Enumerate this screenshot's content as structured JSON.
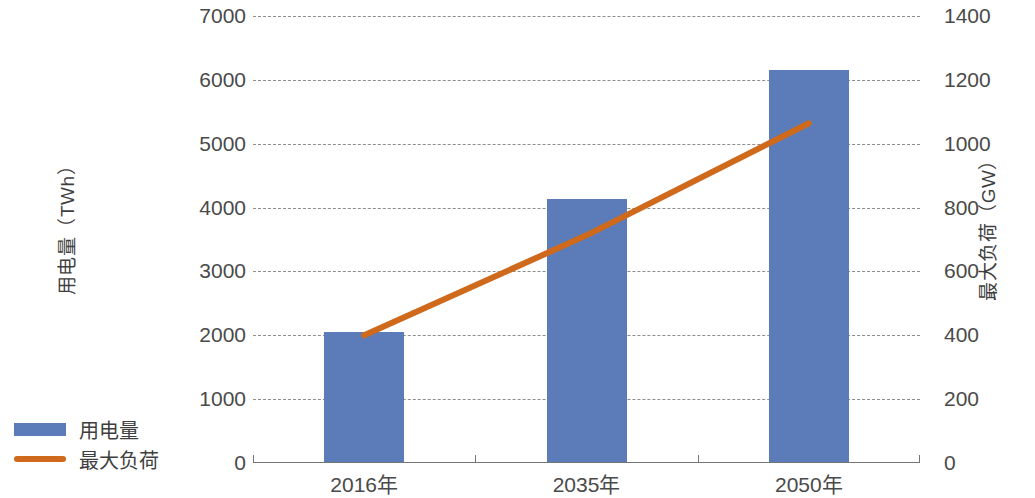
{
  "chart_data": {
    "type": "bar",
    "title": "",
    "subtitle": "",
    "categories": [
      "2016年",
      "2035年",
      "2050年"
    ],
    "series": [
      {
        "name": "用电量",
        "type": "bar",
        "axis": "left",
        "unit": "TWh",
        "color": "#5b7cb8",
        "values": [
          2050,
          4130,
          6150
        ]
      },
      {
        "name": "最大负荷",
        "type": "line",
        "axis": "right",
        "unit": "GW",
        "color": "#cf6a1d",
        "values": [
          400,
          713,
          1064
        ]
      }
    ],
    "xlabel": "",
    "ylabel": "用电量（TWh）",
    "y2label": "最大负荷（GW）",
    "ylim": [
      0,
      7000
    ],
    "y2lim": [
      0,
      1400
    ],
    "yticks": [
      "0",
      "1000",
      "2000",
      "3000",
      "4000",
      "5000",
      "6000",
      "7000"
    ],
    "ytick_values": [
      0,
      1000,
      2000,
      3000,
      4000,
      5000,
      6000,
      7000
    ],
    "y2ticks": [
      "0",
      "200",
      "400",
      "600",
      "800",
      "1000",
      "1200",
      "1400"
    ],
    "y2tick_values": [
      0,
      200,
      400,
      600,
      800,
      1000,
      1200,
      1400
    ],
    "grid": true,
    "grid_style": "dashed",
    "legend_position": "bottom-left",
    "legend": [
      "用电量",
      "最大负荷"
    ]
  },
  "axes": {
    "left_title": "用电量（TWh）",
    "right_title": "最大负荷（GW）"
  },
  "legend": {
    "items": [
      {
        "label": "用电量",
        "marker": "bar-swatch",
        "color": "#5b7cb8"
      },
      {
        "label": "最大负荷",
        "marker": "line-swatch",
        "color": "#cf6a1d"
      }
    ]
  }
}
